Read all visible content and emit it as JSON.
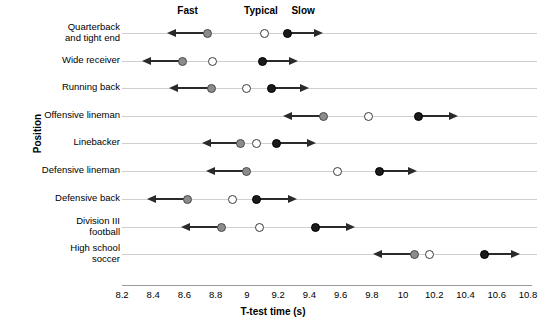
{
  "chart_data": {
    "type": "scatter",
    "title": "",
    "xlabel": "T-test time (s)",
    "ylabel": "Position",
    "xlim": [
      8.2,
      10.8
    ],
    "xticks": [
      "8.2",
      "8.4",
      "8.6",
      "8.8",
      "9",
      "9.2",
      "9.4",
      "9.6",
      "9.8",
      "10",
      "10.2",
      "10.4",
      "10.6",
      "10.8"
    ],
    "xtick_values": [
      8.2,
      8.4,
      8.6,
      8.8,
      9.0,
      9.2,
      9.4,
      9.6,
      9.8,
      10.0,
      10.2,
      10.4,
      10.6,
      10.8
    ],
    "grid": false,
    "legend_position": "top",
    "legend": [
      {
        "name": "Fast",
        "marker": "filled-gray-circle",
        "x_anchor": 8.62,
        "color": "#8c8c8c"
      },
      {
        "name": "Typical",
        "marker": "open-circle",
        "x_anchor": 9.09,
        "color": "#ffffff"
      },
      {
        "name": "Slow",
        "marker": "filled-black-circle",
        "x_anchor": 9.36,
        "color": "#1a1a1a"
      }
    ],
    "categories": [
      "Quarterback and tight end",
      "Wide receiver",
      "Running back",
      "Offensive lineman",
      "Linebacker",
      "Defensive lineman",
      "Defensive back",
      "Division III football",
      "High school soccer"
    ],
    "series": [
      {
        "name": "Fast",
        "values": [
          8.75,
          8.59,
          8.77,
          9.49,
          8.96,
          9.0,
          8.62,
          8.84,
          10.07
        ]
      },
      {
        "name": "Typical",
        "values": [
          9.11,
          8.78,
          9.0,
          9.78,
          9.06,
          9.58,
          8.91,
          9.08,
          10.17
        ]
      },
      {
        "name": "Slow",
        "values": [
          9.26,
          9.1,
          9.16,
          10.1,
          9.19,
          9.85,
          9.06,
          9.44,
          10.52
        ]
      }
    ],
    "rows": [
      {
        "category_lines": [
          "Quarterback",
          "and tight end"
        ],
        "fast": 8.75,
        "typical": 9.11,
        "slow": 9.26,
        "fast_arrow_end": 8.49,
        "slow_arrow_end": 9.49
      },
      {
        "category_lines": [
          "Wide receiver"
        ],
        "fast": 8.59,
        "typical": 8.78,
        "slow": 9.1,
        "fast_arrow_end": 8.33,
        "slow_arrow_end": 9.33
      },
      {
        "category_lines": [
          "Running back"
        ],
        "fast": 8.77,
        "typical": 9.0,
        "slow": 9.16,
        "fast_arrow_end": 8.5,
        "slow_arrow_end": 9.4
      },
      {
        "category_lines": [
          "Offensive lineman"
        ],
        "fast": 9.49,
        "typical": 9.78,
        "slow": 10.1,
        "fast_arrow_end": 9.23,
        "slow_arrow_end": 10.35
      },
      {
        "category_lines": [
          "Linebacker"
        ],
        "fast": 8.96,
        "typical": 9.06,
        "slow": 9.19,
        "fast_arrow_end": 8.71,
        "slow_arrow_end": 9.44
      },
      {
        "category_lines": [
          "Defensive lineman"
        ],
        "fast": 9.0,
        "typical": 9.58,
        "slow": 9.85,
        "fast_arrow_end": 8.74,
        "slow_arrow_end": 10.09
      },
      {
        "category_lines": [
          "Defensive back"
        ],
        "fast": 8.62,
        "typical": 8.91,
        "slow": 9.06,
        "fast_arrow_end": 8.36,
        "slow_arrow_end": 9.32
      },
      {
        "category_lines": [
          "Division III",
          "football"
        ],
        "fast": 8.84,
        "typical": 9.08,
        "slow": 9.44,
        "fast_arrow_end": 8.58,
        "slow_arrow_end": 9.69
      },
      {
        "category_lines": [
          "High school",
          "soccer"
        ],
        "fast": 10.07,
        "typical": 10.17,
        "slow": 10.52,
        "fast_arrow_end": 9.81,
        "slow_arrow_end": 10.75
      }
    ]
  },
  "colors": {
    "fast": "#8c8c8c",
    "typical": "#ffffff",
    "slow": "#1a1a1a",
    "arrow": "#2a2a2a",
    "rowline": "#cfcfcf",
    "axis": "#9a9a9a"
  }
}
